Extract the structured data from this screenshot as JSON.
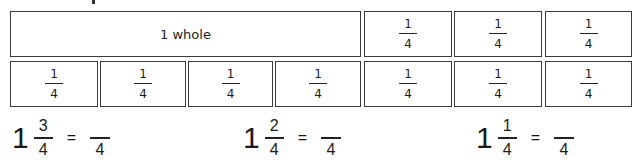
{
  "fraction_strips": {
    "top_row": [
      {
        "label": "1 whole"
      },
      {
        "numerator": "1",
        "denominator": "4"
      },
      {
        "numerator": "1",
        "denominator": "4"
      },
      {
        "numerator": "1",
        "denominator": "4"
      }
    ],
    "bottom_row": [
      {
        "numerator": "1",
        "denominator": "4"
      },
      {
        "numerator": "1",
        "denominator": "4"
      },
      {
        "numerator": "1",
        "denominator": "4"
      },
      {
        "numerator": "1",
        "denominator": "4"
      },
      {
        "numerator": "1",
        "denominator": "4"
      },
      {
        "numerator": "1",
        "denominator": "4"
      },
      {
        "numerator": "1",
        "denominator": "4"
      }
    ]
  },
  "equations": [
    {
      "whole": "1",
      "numerator": "3",
      "denominator": "4",
      "equals": "=",
      "answer_numerator": "",
      "answer_denominator": "4"
    },
    {
      "whole": "1",
      "numerator": "2",
      "denominator": "4",
      "equals": "=",
      "answer_numerator": "",
      "answer_denominator": "4"
    },
    {
      "whole": "1",
      "numerator": "1",
      "denominator": "4",
      "equals": "=",
      "answer_numerator": "",
      "answer_denominator": "4"
    }
  ]
}
